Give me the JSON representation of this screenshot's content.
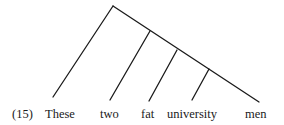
{
  "example_number": "(15)",
  "words": [
    "These",
    "two",
    "fat",
    "university",
    "men"
  ],
  "tree": {
    "root": [
      113,
      6
    ],
    "spine_end": [
      259,
      102
    ],
    "branch_nodes": [
      [
        150,
        31
      ],
      [
        177,
        50
      ],
      [
        209,
        69
      ]
    ],
    "leaf_ends": [
      [
        53,
        97
      ],
      [
        110,
        100
      ],
      [
        149,
        101
      ],
      [
        192,
        100
      ]
    ]
  },
  "colors": {
    "ink": "#1a1a1a",
    "background": "#ffffff"
  }
}
